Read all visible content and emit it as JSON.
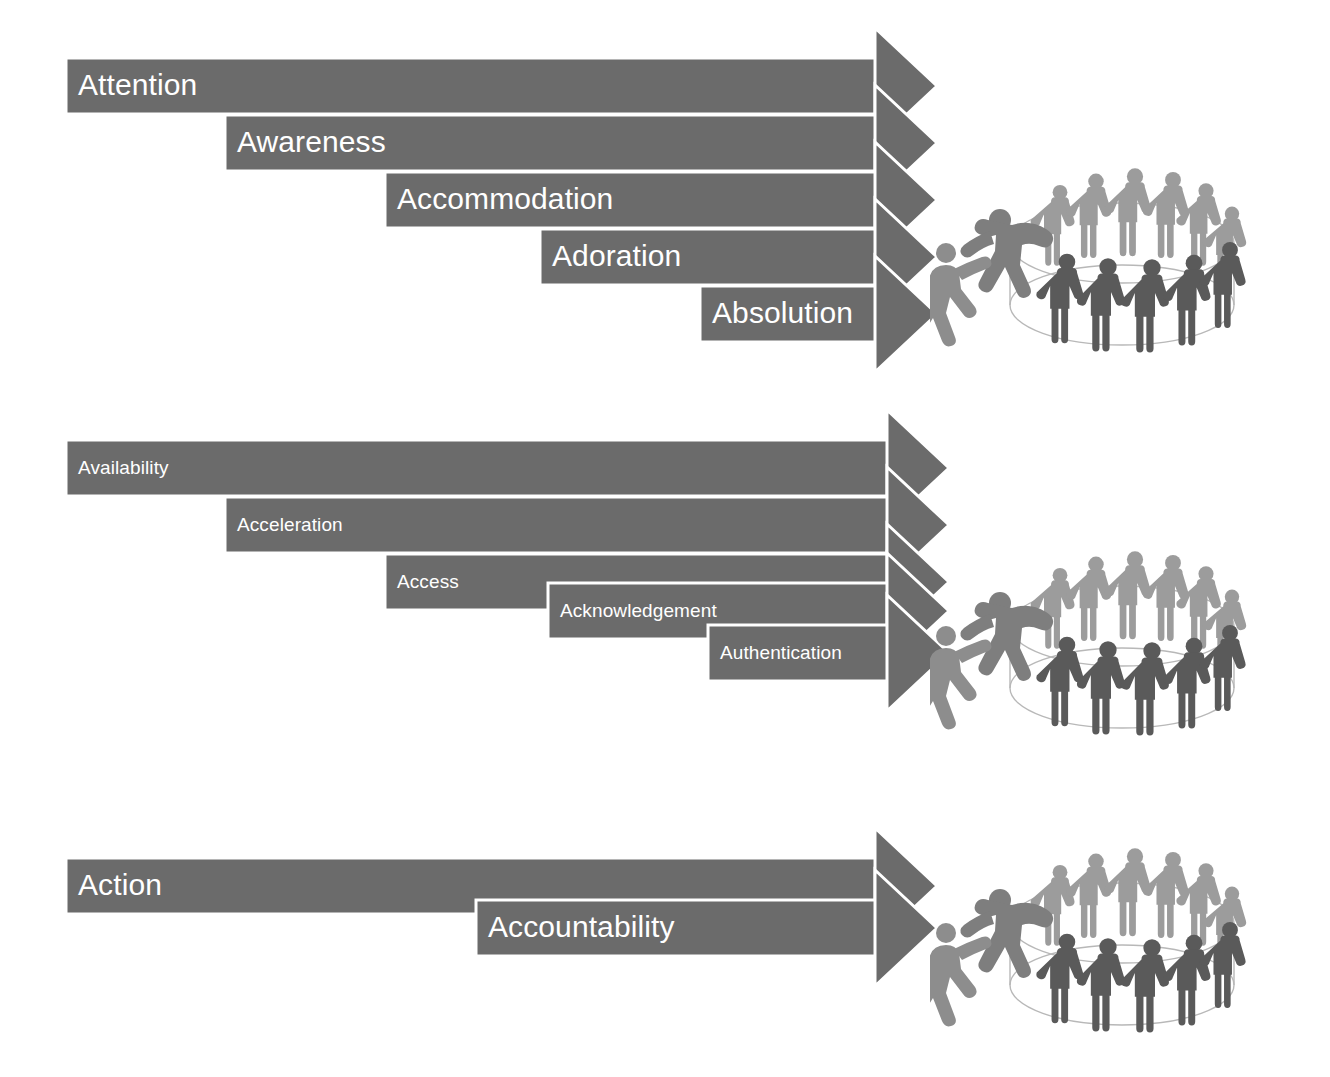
{
  "diagram": {
    "colors": {
      "arrow_fill": "#6b6b6b",
      "arrow_separator": "#ffffff",
      "label_text": "#ffffff",
      "page_background": "#ffffff",
      "people_back_row": "#9c9c9c",
      "people_front_row": "#5a5a5a",
      "people_helper_mid": "#7e7e7e",
      "people_reaching": "#8d8d8d",
      "ellipse_stroke": "#b8b8b8"
    },
    "groups": [
      {
        "id": "group-attention",
        "name": "attention-group",
        "y": 58,
        "font_size": 30,
        "arrows": [
          {
            "label": "Attention",
            "x": 66,
            "y": 58,
            "width": 810,
            "height": 56
          },
          {
            "label": "Awareness",
            "x": 225,
            "y": 115,
            "width": 651,
            "height": 56
          },
          {
            "label": "Accommodation",
            "x": 385,
            "y": 172,
            "width": 491,
            "height": 56
          },
          {
            "label": "Adoration",
            "x": 540,
            "y": 229,
            "width": 336,
            "height": 56
          },
          {
            "label": "Absolution",
            "x": 700,
            "y": 286,
            "width": 176,
            "height": 56
          }
        ],
        "people_graphic": {
          "x": 930,
          "y": 125,
          "width": 330,
          "height": 235
        }
      },
      {
        "id": "group-availability",
        "name": "availability-group",
        "y": 440,
        "font_size": 19,
        "arrows": [
          {
            "label": "Availability",
            "x": 66,
            "y": 440,
            "width": 822,
            "height": 56
          },
          {
            "label": "Acceleration",
            "x": 225,
            "y": 497,
            "width": 663,
            "height": 56
          },
          {
            "label": "Access",
            "x": 385,
            "y": 554,
            "width": 503,
            "height": 56
          },
          {
            "label": "Acknowledgement",
            "x": 548,
            "y": 583,
            "width": 340,
            "height": 56
          },
          {
            "label": "Authentication",
            "x": 708,
            "y": 625,
            "width": 180,
            "height": 56
          }
        ],
        "people_graphic": {
          "x": 930,
          "y": 508,
          "width": 330,
          "height": 235
        }
      },
      {
        "id": "group-action",
        "name": "action-group",
        "y": 858,
        "font_size": 30,
        "arrows": [
          {
            "label": "Action",
            "x": 66,
            "y": 858,
            "width": 810,
            "height": 56
          },
          {
            "label": "Accountability",
            "x": 476,
            "y": 900,
            "width": 400,
            "height": 56
          }
        ],
        "people_graphic": {
          "x": 930,
          "y": 805,
          "width": 330,
          "height": 235
        }
      }
    ],
    "people_graphic_parts": {
      "ellipse_label": "platform-ellipse",
      "back_row_count": 6,
      "front_row_count": 5,
      "helper_label": "helping-hand-figures",
      "reaching_label": "reaching-figure"
    }
  }
}
